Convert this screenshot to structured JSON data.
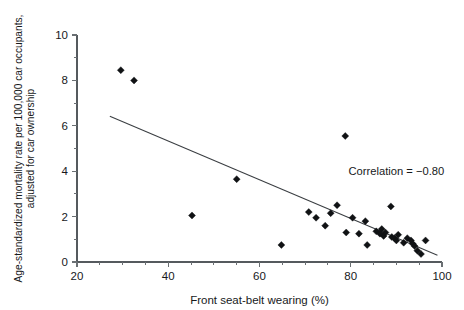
{
  "chart_data": {
    "type": "scatter",
    "title": "",
    "xlabel": "Front seat-belt wearing (%)",
    "ylabel": "Age-standardized mortality rate per 100,000 car occupants, adjusted for car ownership",
    "ylabel_line1": "Age-standardized mortality rate per 100,000 car occupants,",
    "ylabel_line2": "adjusted for car ownership",
    "xlim": [
      20,
      100
    ],
    "ylim": [
      0,
      10
    ],
    "xticks": [
      20,
      40,
      60,
      80,
      100
    ],
    "yticks": [
      0,
      2,
      4,
      6,
      8,
      10
    ],
    "xtick_labels": [
      "20",
      "40",
      "60",
      "80",
      "100"
    ],
    "ytick_labels": [
      "0",
      "2",
      "4",
      "6",
      "8",
      "10"
    ],
    "xminor_ticks": [
      25,
      30,
      35,
      45,
      50,
      55,
      65,
      70,
      75,
      85,
      90,
      95
    ],
    "yminor_ticks": [
      1,
      3,
      5,
      7,
      9
    ],
    "grid": false,
    "legend": false,
    "marker_style": "filled-diamond",
    "marker_color": "#101214",
    "points": [
      {
        "x": 29.6,
        "y": 8.45
      },
      {
        "x": 32.5,
        "y": 8.0
      },
      {
        "x": 45.2,
        "y": 2.05
      },
      {
        "x": 55.0,
        "y": 3.65
      },
      {
        "x": 64.8,
        "y": 0.75
      },
      {
        "x": 70.8,
        "y": 2.2
      },
      {
        "x": 72.4,
        "y": 1.95
      },
      {
        "x": 74.4,
        "y": 1.6
      },
      {
        "x": 75.6,
        "y": 2.15
      },
      {
        "x": 77.0,
        "y": 2.5
      },
      {
        "x": 78.8,
        "y": 5.55
      },
      {
        "x": 79.0,
        "y": 1.3
      },
      {
        "x": 80.4,
        "y": 1.95
      },
      {
        "x": 81.8,
        "y": 1.25
      },
      {
        "x": 83.2,
        "y": 1.8
      },
      {
        "x": 83.6,
        "y": 0.75
      },
      {
        "x": 85.6,
        "y": 1.35
      },
      {
        "x": 86.4,
        "y": 1.25
      },
      {
        "x": 86.8,
        "y": 1.45
      },
      {
        "x": 87.2,
        "y": 1.15
      },
      {
        "x": 87.6,
        "y": 1.3
      },
      {
        "x": 88.8,
        "y": 2.45
      },
      {
        "x": 89.0,
        "y": 1.1
      },
      {
        "x": 89.6,
        "y": 1.05
      },
      {
        "x": 90.0,
        "y": 0.95
      },
      {
        "x": 90.4,
        "y": 1.2
      },
      {
        "x": 91.6,
        "y": 0.85
      },
      {
        "x": 92.4,
        "y": 1.05
      },
      {
        "x": 93.2,
        "y": 0.95
      },
      {
        "x": 93.6,
        "y": 0.8
      },
      {
        "x": 94.0,
        "y": 0.7
      },
      {
        "x": 94.6,
        "y": 0.5
      },
      {
        "x": 95.4,
        "y": 0.35
      },
      {
        "x": 96.4,
        "y": 0.95
      }
    ],
    "fit_line": {
      "x_start": 27.2,
      "y_start": 6.42,
      "x_end": 99.0,
      "y_end": 0.3
    },
    "annotations": [
      {
        "text": "Correlation = −0.80",
        "x": 79.5,
        "y": 3.85
      }
    ]
  }
}
